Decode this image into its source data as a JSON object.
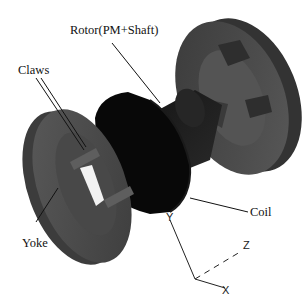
{
  "diagram": {
    "type": "exploded 3D assembly",
    "labels": {
      "rotor": "Rotor(PM+Shaft)",
      "claws": "Claws",
      "yoke": "Yoke",
      "coil": "Coil"
    },
    "axes": {
      "y": "Y",
      "z": "Z",
      "x": "X"
    },
    "colors": {
      "background": "#ffffff",
      "yoke_body": "#4a4a4a",
      "yoke_face": "#5c5c5c",
      "coil": "#0a0a0a",
      "rotor_shaft": "#1c1c1c",
      "leader_line": "#111111",
      "claw_slot": "#f2f2f2"
    }
  }
}
